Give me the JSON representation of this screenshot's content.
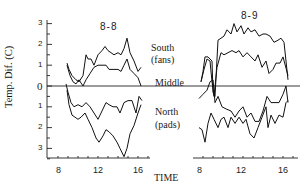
{
  "chart_data": {
    "type": "line",
    "ylabel": "Temp. Dif.  (C)",
    "xlabel": "TIME",
    "y_ticks_upper": [
      "3",
      "2",
      "1",
      "0"
    ],
    "y_ticks_lower": [
      "1",
      "2",
      "3"
    ],
    "y_range": [
      -3.5,
      3
    ],
    "annotations": {
      "south": "South",
      "south_sub": "(fans)",
      "middle": "Middle",
      "north": "North",
      "north_sub": "(pads)"
    },
    "panels": [
      {
        "title": "8-8",
        "x_ticks": [
          "8",
          "12",
          "16"
        ],
        "series": [
          {
            "name": "South (fans) upper",
            "x": [
              8.9,
              9.1,
              9.4,
              9.8,
              10.1,
              10.5,
              10.8,
              11.0,
              11.3,
              11.6,
              12.0,
              12.4,
              12.7,
              13.0,
              13.3,
              13.6,
              14.0,
              14.3,
              14.6,
              14.9,
              15.2,
              15.6,
              16.0,
              16.3
            ],
            "y": [
              1.1,
              0.8,
              0.5,
              0.3,
              0.2,
              0.5,
              1.5,
              1.3,
              1.3,
              1.0,
              1.5,
              1.7,
              1.9,
              1.7,
              1.6,
              1.5,
              1.6,
              1.5,
              1.8,
              2.3,
              1.6,
              1.2,
              0.7,
              0.9
            ]
          },
          {
            "name": "South (fans) lower",
            "x": [
              8.9,
              9.2,
              9.5,
              9.8,
              10.1,
              10.5,
              10.8,
              11.2,
              11.6,
              12.0,
              12.4,
              12.8,
              13.1,
              13.5,
              14.0,
              14.3,
              14.6,
              14.9,
              15.2,
              15.6,
              16.0,
              16.3
            ],
            "y": [
              1.0,
              0.5,
              0.2,
              0.1,
              0.3,
              0.0,
              0.3,
              0.6,
              0.9,
              1.0,
              1.0,
              1.0,
              0.8,
              0.8,
              0.8,
              0.7,
              1.0,
              1.3,
              0.8,
              0.6,
              0.4,
              0.0
            ]
          },
          {
            "name": "North (pads) upper",
            "x": [
              8.8,
              9.0,
              9.3,
              9.6,
              10.0,
              10.4,
              10.8,
              11.2,
              11.6,
              12.0,
              12.4,
              12.8,
              13.1,
              13.5,
              13.9,
              14.2,
              14.6,
              15.0,
              15.4,
              15.8,
              16.1,
              16.4
            ],
            "y": [
              0.1,
              -0.3,
              -0.8,
              -1.0,
              -0.9,
              -1.0,
              -0.8,
              -1.0,
              -1.3,
              -1.6,
              -1.2,
              -0.8,
              -0.9,
              -1.0,
              -1.0,
              -1.3,
              -0.8,
              -0.7,
              -0.7,
              -1.3,
              -0.5,
              -0.7
            ]
          },
          {
            "name": "North (pads) lower",
            "x": [
              8.9,
              9.1,
              9.4,
              9.7,
              10.0,
              10.3,
              10.7,
              11.0,
              11.4,
              11.8,
              12.1,
              12.5,
              12.8,
              13.1,
              13.5,
              13.9,
              14.2,
              14.6,
              14.9,
              15.2,
              15.6,
              16.0,
              16.3
            ],
            "y": [
              -0.2,
              -0.9,
              -1.4,
              -1.5,
              -1.6,
              -1.5,
              -1.3,
              -1.6,
              -2.0,
              -2.5,
              -2.7,
              -2.4,
              -2.1,
              -2.2,
              -2.4,
              -2.7,
              -3.0,
              -3.4,
              -3.0,
              -2.3,
              -1.9,
              -1.3,
              -0.9
            ]
          }
        ]
      },
      {
        "title": "8-9",
        "x_ticks": [
          "8",
          "12",
          "16"
        ],
        "series": [
          {
            "name": "South (fans) upper",
            "x": [
              7.8,
              8.0,
              8.2,
              8.5,
              8.7,
              8.9,
              9.0,
              9.2,
              9.5,
              9.8,
              10.1,
              10.4,
              10.8,
              11.1,
              11.4,
              11.8,
              12.1,
              12.5,
              12.8,
              13.2,
              13.6,
              14.0,
              14.3,
              14.7,
              15.1,
              15.5,
              15.8,
              16.1,
              16.5
            ],
            "y": [
              0.2,
              0.7,
              1.4,
              1.4,
              1.3,
              1.2,
              -0.3,
              -0.5,
              2.2,
              2.3,
              2.4,
              2.7,
              2.5,
              3.0,
              2.6,
              2.9,
              2.5,
              2.8,
              2.6,
              2.7,
              2.4,
              2.5,
              2.5,
              2.4,
              2.1,
              2.2,
              2.3,
              2.1,
              0.3
            ]
          },
          {
            "name": "South (fans) lower",
            "x": [
              7.8,
              8.1,
              8.4,
              8.7,
              8.9,
              9.1,
              9.4,
              9.8,
              10.1,
              10.5,
              10.9,
              11.3,
              11.6,
              12.0,
              12.4,
              12.8,
              13.2,
              13.5,
              13.9,
              14.3,
              14.6,
              15.0,
              15.3,
              15.7,
              16.0,
              16.5
            ],
            "y": [
              0.2,
              0.8,
              1.3,
              1.2,
              0.2,
              -0.5,
              0.9,
              1.6,
              1.5,
              1.6,
              1.7,
              1.6,
              1.7,
              1.4,
              1.6,
              1.4,
              1.2,
              1.5,
              0.9,
              1.2,
              0.6,
              0.8,
              1.1,
              1.1,
              1.4,
              0.5
            ]
          },
          {
            "name": "North (pads) upper",
            "x": [
              7.6,
              8.0,
              8.4,
              8.7,
              9.0,
              9.2,
              9.5,
              9.9,
              10.3,
              10.8,
              11.2,
              11.6,
              12.0,
              12.4,
              12.8,
              13.2,
              13.6,
              14.0,
              14.4,
              14.8,
              15.2,
              15.6,
              16.0,
              16.3,
              16.5
            ],
            "y": [
              -0.6,
              -0.4,
              -0.2,
              0.2,
              0.3,
              -0.8,
              -0.5,
              -1.0,
              -1.1,
              -1.2,
              -1.5,
              -1.2,
              -1.0,
              -1.5,
              -1.3,
              -1.7,
              -1.7,
              -1.2,
              -0.5,
              -0.8,
              -0.8,
              -0.8,
              -0.4,
              0.0,
              -0.8
            ]
          },
          {
            "name": "North (pads) lower",
            "x": [
              7.6,
              7.9,
              8.2,
              8.5,
              8.8,
              9.1,
              9.5,
              9.8,
              10.1,
              10.5,
              10.8,
              11.2,
              11.6,
              12.0,
              12.3,
              12.7,
              13.1,
              13.5,
              13.9,
              14.3,
              14.5,
              14.8,
              15.2,
              15.6,
              16.0,
              16.3,
              16.5
            ],
            "y": [
              -2.0,
              -2.1,
              -2.7,
              -1.8,
              -1.3,
              -1.6,
              -2.0,
              -1.6,
              -1.5,
              -2.0,
              -1.5,
              -1.8,
              -1.5,
              -1.8,
              -1.6,
              -2.3,
              -2.5,
              -2.0,
              -1.5,
              -1.0,
              -2.0,
              -1.4,
              -1.8,
              -1.4,
              -1.5,
              -0.8,
              -0.7
            ]
          }
        ]
      }
    ]
  }
}
